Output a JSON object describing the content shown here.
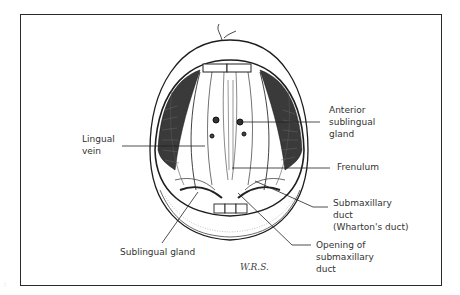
{
  "figure": {
    "labels": {
      "anterior_sublingual_gland": "Anterior\nsublingual\ngland",
      "lingual_vein": "Lingual\nvein",
      "frenulum": "Frenulum",
      "submaxillary_duct": "Submaxillary\nduct\n(Wharton's duct)",
      "sublingual_gland": "Sublingual gland",
      "opening_submaxillary_duct": "Opening of\nsubmaxillary\nduct"
    },
    "signature": "W.R.S.",
    "margin_mark": ":"
  },
  "colors": {
    "line": "#222222",
    "text": "#333333",
    "frame": "#2a2a2a"
  }
}
